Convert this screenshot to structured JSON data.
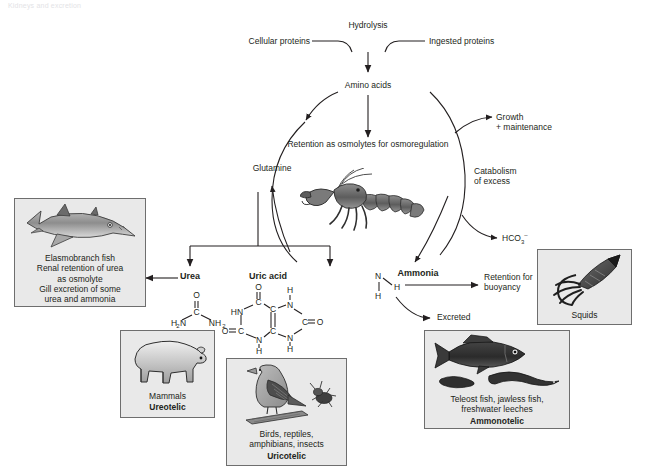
{
  "page": {
    "running_head": "Kidneys and excretion",
    "width": 651,
    "height": 473
  },
  "flow_labels": {
    "hydrolysis": "Hydrolysis",
    "cellular_proteins": "Cellular proteins",
    "ingested_proteins": "Ingested proteins",
    "amino_acids": "Amino acids",
    "retention_osmolytes": "Retention as osmolytes for osmoregulation",
    "glutamine": "Glutamine",
    "growth": "Growth\n+ maintenance",
    "catabolism": "Catabolism\nof excess",
    "bicarbonate": "HCO3–",
    "bicarbonate_base": "HCO",
    "bicarbonate_sub": "3",
    "bicarbonate_sup": "–",
    "urea": "Urea",
    "uric_acid": "Uric acid",
    "ammonia": "Ammonia",
    "retention_buoyancy": "Retention for\nbuoyancy",
    "excreted": "Excreted"
  },
  "chem": {
    "urea": {
      "o": "O",
      "c": "C",
      "h2n": "H₂N",
      "nh2": "NH₂"
    },
    "uric_acid": {
      "o_top": "O",
      "hn_left": "HN",
      "c_top": "C",
      "c_mid_up": "C",
      "n_right_top": "N",
      "h_top_right": "H",
      "o_left": "O",
      "c_left": "C",
      "c_mid_low": "C",
      "n_bottom": "N",
      "h_bottom": "H",
      "c_right": "C",
      "o_right": "O",
      "n_right_bottom": "N",
      "h_right_bottom": "H"
    },
    "ammonia": {
      "n": "N",
      "h_left": "H",
      "h_right": "H",
      "h_bottom": "H"
    }
  },
  "panels": [
    {
      "id": "elasmobranch",
      "caption": "Elasmobranch fish\nRenal retention of urea\nas osmolyte\nGill excretion of some\nurea and ammonia",
      "caption_bold": "",
      "animal": "shark"
    },
    {
      "id": "mammals",
      "caption": "Mammals",
      "caption_bold": "Ureotelic",
      "animal": "bear"
    },
    {
      "id": "birds",
      "caption": "Birds, reptiles,\namphibians, insects",
      "caption_bold": "Uricotelic",
      "animal": "bird-and-insect"
    },
    {
      "id": "teleost",
      "caption": "Teleost fish, jawless fish,\nfreshwater leeches",
      "caption_bold": "Ammonotelic",
      "animal": "fish-lamprey-leech"
    },
    {
      "id": "squids",
      "caption": "Squids",
      "caption_bold": "",
      "animal": "squid"
    }
  ],
  "center_image": {
    "name": "crayfish-illustration"
  },
  "colors": {
    "ink": "#231f20",
    "panel_fill": "#e9e9e9",
    "panel_border": "#6e6e6e",
    "animal_dark": "#3a3a3a",
    "animal_mid": "#8e8e8e",
    "animal_light": "#cfcfcf"
  }
}
